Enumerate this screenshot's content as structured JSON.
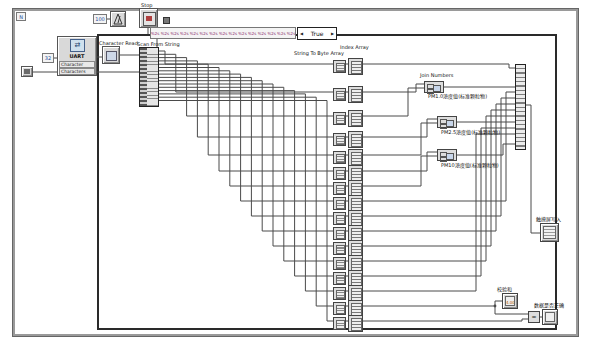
{
  "window": {
    "background": "#ffffff"
  },
  "loop": {
    "count_label": "N"
  },
  "timing": {
    "wait_constant": "100"
  },
  "stop": {
    "label": "Stop"
  },
  "case_structure": {
    "selector_label": "True",
    "arrow_left": "◀",
    "arrow_right": "▶"
  },
  "uart": {
    "title": "UART",
    "icon": "⇄",
    "count_constant": "32",
    "input_label": "Character Coun",
    "output_label": "Characters Read"
  },
  "nodes": {
    "character_read_label": "Character Read",
    "scan_from_string_label": "Scan From String",
    "format_string": "%2s %2s %2s %2s %2s %2s %2s %2s %2s %2s %2s %2s %2s %2s %2s %2s %2s",
    "string_to_byte_array_label": "String To Byte Array",
    "index_array_label": "Index Array",
    "join_numbers_label": "Join Numbers",
    "comparator_glyph": "="
  },
  "joins": {
    "outputs": [
      "PM1.0浓度值(标准颗粒物)",
      "PM2.5浓度值(标准颗粒物)",
      "PM10浓度值(标准颗粒物)"
    ]
  },
  "indicators": {
    "array_label": "触摸屏写入",
    "checksum_label": "校验和",
    "checksum_value": "4.00",
    "valid_label": "数据是否正确"
  },
  "structure": {
    "converter_row_count": 16,
    "build_array_input_count": 20
  },
  "colors": {
    "wire": "#4a4a4a",
    "node_fill": "#d9d9d9",
    "structure_border": "#2a2a2a"
  }
}
